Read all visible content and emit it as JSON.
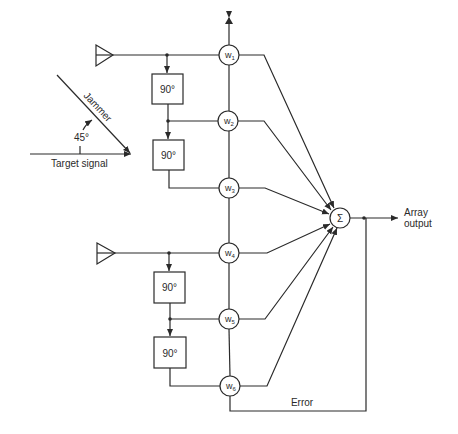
{
  "diagram": {
    "type": "adaptive-array-block-diagram",
    "colors": {
      "line": "#2a2a2a",
      "background": "#ffffff"
    },
    "signals": {
      "jammer_label": "Jammer",
      "target_label": "Target signal",
      "angle_label": "45°"
    },
    "phase_shifters": [
      {
        "label": "90°"
      },
      {
        "label": "90°"
      },
      {
        "label": "90°"
      },
      {
        "label": "90°"
      }
    ],
    "weights": [
      {
        "base": "w",
        "sub": "1"
      },
      {
        "base": "w",
        "sub": "2"
      },
      {
        "base": "w",
        "sub": "3"
      },
      {
        "base": "w",
        "sub": "4"
      },
      {
        "base": "w",
        "sub": "5"
      },
      {
        "base": "w",
        "sub": "6"
      }
    ],
    "summer": {
      "label": "Σ"
    },
    "output": {
      "line1": "Array",
      "line2": "output"
    },
    "feedback": {
      "label": "Error"
    }
  }
}
